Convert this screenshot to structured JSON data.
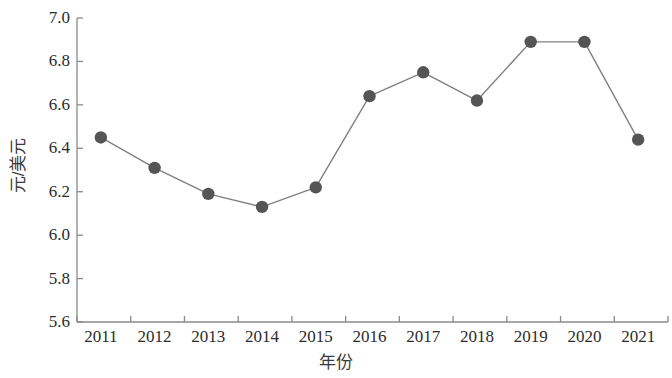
{
  "chart_data": {
    "type": "line",
    "title": "",
    "xlabel": "年份",
    "ylabel": "元/美元",
    "categories": [
      "2011",
      "2012",
      "2013",
      "2014",
      "2015",
      "2016",
      "2017",
      "2018",
      "2019",
      "2020",
      "2021"
    ],
    "values": [
      6.45,
      6.31,
      6.19,
      6.13,
      6.22,
      6.64,
      6.75,
      6.62,
      6.89,
      6.89,
      6.44
    ],
    "ylim": [
      5.6,
      7.0
    ],
    "ytick_labels": [
      "5.6",
      "5.8",
      "6.0",
      "6.2",
      "6.4",
      "6.6",
      "6.8",
      "7.0"
    ],
    "ytick_values": [
      5.6,
      5.8,
      6.0,
      6.2,
      6.4,
      6.6,
      6.8,
      7.0
    ],
    "grid": false,
    "legend": null,
    "series": [
      {
        "name": "元/美元",
        "values": [
          6.45,
          6.31,
          6.19,
          6.13,
          6.22,
          6.64,
          6.75,
          6.62,
          6.89,
          6.89,
          6.44
        ],
        "marker": "circle",
        "marker_color": "#555555",
        "line_color": "#808080"
      }
    ]
  },
  "axes": {
    "axis_color": "#8a8a8a",
    "tick_color": "#8a8a8a",
    "text_color": "#2b2b2b"
  }
}
